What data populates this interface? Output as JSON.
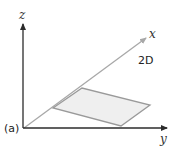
{
  "figure": {
    "panel_label": "(a)",
    "dimension_label": "2D",
    "axes": {
      "z": {
        "label": "z"
      },
      "y": {
        "label": "y"
      },
      "x": {
        "label": "x"
      }
    },
    "shape": {
      "type": "parallelogram",
      "fill": "#efefef",
      "stroke": "#9a9a9a"
    },
    "colors": {
      "axis_dark": "#2b2b2b",
      "axis_light": "#a8a8a8"
    }
  }
}
